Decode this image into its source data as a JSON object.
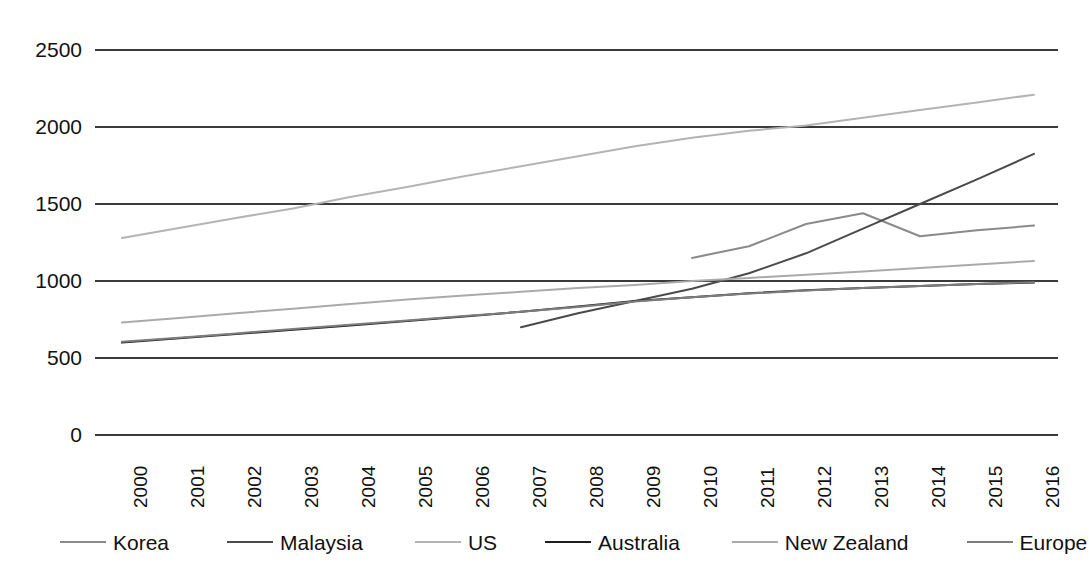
{
  "chart_data": {
    "type": "line",
    "title": "",
    "xlabel": "",
    "ylabel": "",
    "categories": [
      "2000",
      "2001",
      "2002",
      "2003",
      "2004",
      "2005",
      "2006",
      "2007",
      "2008",
      "2009",
      "2010",
      "2011",
      "2012",
      "2013",
      "2014",
      "2015",
      "2016"
    ],
    "yticks": [
      0,
      500,
      1000,
      1500,
      2000,
      2500
    ],
    "ylim": [
      0,
      2500
    ],
    "grid": "horizontal",
    "legend_position": "bottom",
    "series": [
      {
        "name": "Korea",
        "color": "#8a8a8a",
        "width": 2,
        "values": [
          null,
          null,
          null,
          null,
          null,
          null,
          null,
          null,
          null,
          null,
          1150,
          1225,
          1370,
          1440,
          1290,
          1330,
          1360
        ]
      },
      {
        "name": "Malaysia",
        "color": "#4a4a4a",
        "width": 2,
        "values": [
          null,
          null,
          null,
          null,
          null,
          null,
          null,
          700,
          790,
          870,
          950,
          1050,
          1180,
          1340,
          1500,
          1660,
          1825
        ]
      },
      {
        "name": "US",
        "color": "#b4b4b4",
        "width": 2,
        "values": [
          1280,
          1345,
          1410,
          1470,
          1545,
          1610,
          1680,
          1745,
          1810,
          1875,
          1930,
          1975,
          2010,
          2060,
          2110,
          2160,
          2210
        ]
      },
      {
        "name": "Australia",
        "color": "#1e1e1e",
        "width": 2,
        "values": [
          600,
          628,
          656,
          684,
          712,
          740,
          770,
          800,
          835,
          870,
          895,
          920,
          940,
          955,
          968,
          980,
          990
        ]
      },
      {
        "name": "New Zealand",
        "color": "#aaaaaa",
        "width": 2,
        "values": [
          730,
          760,
          790,
          820,
          850,
          880,
          905,
          930,
          955,
          975,
          1000,
          1020,
          1040,
          1062,
          1085,
          1108,
          1130
        ]
      },
      {
        "name": "Europe",
        "color": "#7d7d7d",
        "width": 2,
        "values": [
          605,
          632,
          660,
          688,
          716,
          744,
          772,
          800,
          832,
          866,
          894,
          918,
          938,
          954,
          968,
          980,
          992
        ]
      }
    ],
    "korea_note": "Korea series begins at 2010",
    "malaysia_note": "Malaysia series begins at 2007"
  },
  "geometry": {
    "plot_left": 122,
    "plot_right": 1034,
    "plot_top": 50,
    "plot_bottom": 435,
    "axis_line_left": 95,
    "axis_line_right": 1058
  }
}
